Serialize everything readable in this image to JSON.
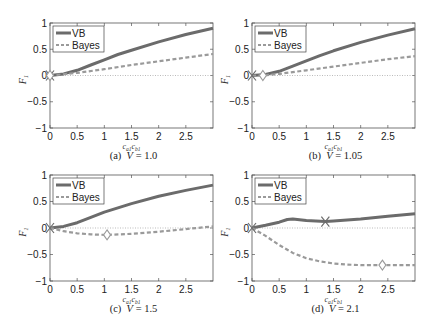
{
  "chart_data": [
    {
      "type": "line",
      "panel": "a",
      "caption": "(a)  V = 1.0",
      "xlabel": "c_{a1} c_{b1}",
      "ylabel": "F_1",
      "xlim": [
        0,
        3
      ],
      "ylim": [
        -1,
        1
      ],
      "xticks": [
        "0",
        "0.5",
        "1",
        "1.5",
        "2",
        "2.5"
      ],
      "yticks": [
        "−1",
        "−0.5",
        "0",
        "0.5",
        "1"
      ],
      "legend": [
        "VB",
        "Bayes"
      ],
      "legend_position": "upper left",
      "reference_line_y": 0,
      "series": [
        {
          "name": "VB",
          "x": [
            0,
            0.25,
            0.5,
            0.75,
            1.0,
            1.25,
            1.5,
            2.0,
            2.5,
            3.0
          ],
          "y": [
            0,
            0.03,
            0.1,
            0.2,
            0.3,
            0.4,
            0.48,
            0.64,
            0.78,
            0.9
          ]
        },
        {
          "name": "Bayes",
          "x": [
            0,
            0.5,
            1.0,
            1.5,
            2.0,
            2.5,
            3.0
          ],
          "y": [
            0,
            0.05,
            0.12,
            0.2,
            0.27,
            0.34,
            0.41
          ]
        }
      ],
      "markers": [
        {
          "series": "VB",
          "shape": "x",
          "x": 0,
          "y": 0
        },
        {
          "series": "Bayes",
          "shape": "diamond",
          "x": 0,
          "y": 0
        }
      ]
    },
    {
      "type": "line",
      "panel": "b",
      "caption": "(b)  V = 1.05",
      "xlabel": "c_{a1} c_{b1}",
      "ylabel": "F_1",
      "xlim": [
        0,
        3
      ],
      "ylim": [
        -1,
        1
      ],
      "xticks": [
        "0",
        "0.5",
        "1",
        "1.5",
        "2",
        "2.5"
      ],
      "yticks": [
        "−1",
        "−0.5",
        "0",
        "0.5",
        "1"
      ],
      "legend": [
        "VB",
        "Bayes"
      ],
      "legend_position": "upper left",
      "reference_line_y": 0,
      "series": [
        {
          "name": "VB",
          "x": [
            0,
            0.25,
            0.5,
            0.75,
            1.0,
            1.25,
            1.5,
            2.0,
            2.5,
            3.0
          ],
          "y": [
            0,
            0.02,
            0.08,
            0.18,
            0.28,
            0.38,
            0.47,
            0.63,
            0.77,
            0.89
          ]
        },
        {
          "name": "Bayes",
          "x": [
            0,
            0.2,
            0.5,
            1.0,
            1.5,
            2.0,
            2.5,
            3.0
          ],
          "y": [
            0,
            0.0,
            0.03,
            0.1,
            0.17,
            0.24,
            0.31,
            0.37
          ]
        }
      ],
      "markers": [
        {
          "series": "VB",
          "shape": "x",
          "x": 0,
          "y": 0
        },
        {
          "series": "Bayes",
          "shape": "diamond",
          "x": 0.2,
          "y": 0
        }
      ]
    },
    {
      "type": "line",
      "panel": "c",
      "caption": "(c)  V = 1.5",
      "xlabel": "c_{a1} c_{b1}",
      "ylabel": "F_1",
      "xlim": [
        0,
        3
      ],
      "ylim": [
        -1,
        1
      ],
      "xticks": [
        "0",
        "0.5",
        "1",
        "1.5",
        "2",
        "2.5"
      ],
      "yticks": [
        "−1",
        "−0.5",
        "0",
        "0.5",
        "1"
      ],
      "legend": [
        "VB",
        "Bayes"
      ],
      "legend_position": "upper left",
      "reference_line_y": 0,
      "series": [
        {
          "name": "VB",
          "x": [
            0,
            0.25,
            0.5,
            0.75,
            1.0,
            1.25,
            1.5,
            2.0,
            2.5,
            3.0
          ],
          "y": [
            0,
            0.03,
            0.1,
            0.2,
            0.3,
            0.38,
            0.46,
            0.6,
            0.71,
            0.81
          ]
        },
        {
          "name": "Bayes",
          "x": [
            0,
            0.25,
            0.5,
            0.75,
            1.05,
            1.5,
            2.0,
            2.5,
            3.0
          ],
          "y": [
            0,
            -0.06,
            -0.1,
            -0.12,
            -0.13,
            -0.11,
            -0.07,
            -0.02,
            0.03
          ]
        }
      ],
      "markers": [
        {
          "series": "VB",
          "shape": "x",
          "x": 0,
          "y": 0
        },
        {
          "series": "Bayes",
          "shape": "diamond",
          "x": 1.05,
          "y": -0.13
        }
      ]
    },
    {
      "type": "line",
      "panel": "d",
      "caption": "(d)  V = 2.1",
      "xlabel": "c_{a1} c_{b1}",
      "ylabel": "F_1",
      "xlim": [
        0,
        3
      ],
      "ylim": [
        -1,
        1
      ],
      "xticks": [
        "0",
        "0.5",
        "1",
        "1.5",
        "2",
        "2.5"
      ],
      "yticks": [
        "−1",
        "−0.5",
        "0",
        "0.5",
        "1"
      ],
      "legend": [
        "VB",
        "Bayes"
      ],
      "legend_position": "upper left",
      "reference_line_y": 0,
      "series": [
        {
          "name": "VB",
          "x": [
            0,
            0.25,
            0.5,
            0.65,
            0.75,
            1.0,
            1.35,
            1.5,
            2.0,
            2.5,
            3.0
          ],
          "y": [
            0,
            0.05,
            0.11,
            0.16,
            0.17,
            0.14,
            0.12,
            0.13,
            0.17,
            0.22,
            0.27
          ]
        },
        {
          "name": "Bayes",
          "x": [
            0,
            0.25,
            0.5,
            0.75,
            1.0,
            1.25,
            1.5,
            1.75,
            2.0,
            2.4,
            3.0
          ],
          "y": [
            0,
            -0.15,
            -0.32,
            -0.47,
            -0.57,
            -0.63,
            -0.67,
            -0.69,
            -0.7,
            -0.7,
            -0.7
          ]
        }
      ],
      "markers": [
        {
          "series": "VB",
          "shape": "x",
          "x": 0,
          "y": 0
        },
        {
          "series": "VB",
          "shape": "x",
          "x": 1.35,
          "y": 0.12
        },
        {
          "series": "Bayes",
          "shape": "diamond",
          "x": 2.4,
          "y": -0.7
        }
      ]
    }
  ],
  "style": {
    "vb_color": "#6b6b6b",
    "bayes_color": "#9a9a9a",
    "axis_color": "#555555",
    "zero_line_color": "#aaaaaa"
  }
}
